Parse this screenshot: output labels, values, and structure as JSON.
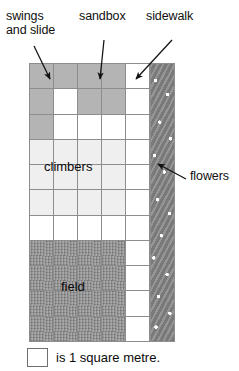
{
  "labels": {
    "swings": "swings\nand slide",
    "sandbox": "sandbox",
    "sidewalk": "sidewalk",
    "flowers": "flowers"
  },
  "areas": {
    "climbers": "climbers",
    "field": "field"
  },
  "legend": {
    "swatch_icon": "white-square-icon",
    "text": "is 1 square metre."
  },
  "colors": {
    "white": "#ffffff",
    "gray": "#b4b4b4",
    "light": "#efefef",
    "field": "#8f8f8f",
    "flowers": "#8a8a8a",
    "gridline": "#8d8d8d",
    "ink": "#0a0a0a"
  },
  "grid": {
    "columns": 5,
    "rows": 11,
    "cell_label": "1 square metre",
    "cells": [
      [
        "gray",
        "gray",
        "gray",
        "gray",
        "white"
      ],
      [
        "gray",
        "white",
        "gray",
        "gray",
        "white"
      ],
      [
        "gray",
        "white",
        "white",
        "white",
        "white"
      ],
      [
        "light",
        "light",
        "light",
        "light",
        "white"
      ],
      [
        "light",
        "light",
        "light",
        "light",
        "white"
      ],
      [
        "light",
        "light",
        "light",
        "light",
        "white"
      ],
      [
        "white",
        "white",
        "white",
        "white",
        "white"
      ],
      [
        "field",
        "field",
        "field",
        "field",
        "white"
      ],
      [
        "field",
        "field",
        "field",
        "field",
        "white"
      ],
      [
        "field",
        "field",
        "field",
        "field",
        "white"
      ],
      [
        "field",
        "field",
        "field",
        "field",
        "white"
      ]
    ]
  },
  "arrows": [
    {
      "name": "arrow-swings",
      "from": [
        34,
        46
      ],
      "to": [
        49,
        80
      ]
    },
    {
      "name": "arrow-sandbox",
      "from": [
        104,
        40
      ],
      "to": [
        100,
        80
      ]
    },
    {
      "name": "arrow-sidewalk",
      "to": [
        135,
        80
      ],
      "from": [
        172,
        40
      ]
    },
    {
      "name": "arrow-flowers",
      "from": [
        186,
        178
      ],
      "to": [
        157,
        163
      ]
    }
  ]
}
